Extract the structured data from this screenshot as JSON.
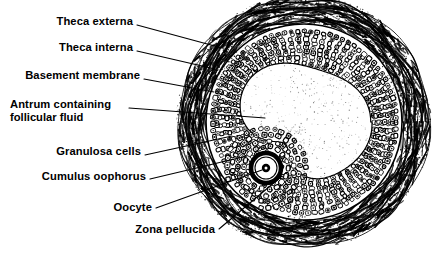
{
  "figure": {
    "background_color": "#ffffff",
    "ink_color": "#000000",
    "labels": [
      {
        "id": "theca-externa",
        "text": "Theca externa",
        "text_x": 133,
        "text_y": 21,
        "align": "right",
        "leader": {
          "x1": 137,
          "y1": 25,
          "x2": 222,
          "y2": 48
        }
      },
      {
        "id": "theca-interna",
        "text": "Theca interna",
        "text_x": 133,
        "text_y": 47,
        "align": "right",
        "leader": {
          "x1": 137,
          "y1": 51,
          "x2": 215,
          "y2": 69
        }
      },
      {
        "id": "basement-membrane",
        "text": "Basement membrane",
        "text_x": 140,
        "text_y": 75,
        "align": "right",
        "leader": {
          "x1": 144,
          "y1": 79,
          "x2": 214,
          "y2": 92
        }
      },
      {
        "id": "antrum",
        "text": "Antrum containing",
        "text_2": "follicular fluid",
        "text_x": 10,
        "text_y": 104,
        "text_2_y": 118,
        "align": "left",
        "leader": {
          "x1": 129,
          "y1": 108,
          "x2": 265,
          "y2": 118
        }
      },
      {
        "id": "granulosa-cells",
        "text": "Granulosa cells",
        "text_x": 141,
        "text_y": 151,
        "align": "right",
        "leader": {
          "x1": 145,
          "y1": 155,
          "x2": 232,
          "y2": 136
        }
      },
      {
        "id": "cumulus-oophorus",
        "text": "Cumulus oophorus",
        "text_x": 146,
        "text_y": 176,
        "align": "right",
        "leader": {
          "x1": 150,
          "y1": 179,
          "x2": 247,
          "y2": 156
        }
      },
      {
        "id": "oocyte",
        "text": "Oocyte",
        "text_x": 152,
        "text_y": 207,
        "align": "right",
        "leader": {
          "x1": 156,
          "y1": 208,
          "x2": 262,
          "y2": 170
        }
      },
      {
        "id": "zona-pellucida",
        "text": "Zona pellucida",
        "text_x": 215,
        "text_y": 230,
        "align": "right",
        "leader": {
          "x1": 219,
          "y1": 229,
          "x2": 282,
          "y2": 176
        }
      }
    ],
    "structure": {
      "center_x": 304,
      "center_y": 122,
      "theca_externa_radius": 128,
      "theca_interna_radius": 112,
      "basement_membrane_radius": 98,
      "granulosa_outer_radius": 96,
      "antrum_radius": 62,
      "oocyte_center_x": 266,
      "oocyte_center_y": 168,
      "zona_outer_radius": 17,
      "oocyte_radius": 11,
      "nucleus_radius": 4
    }
  }
}
